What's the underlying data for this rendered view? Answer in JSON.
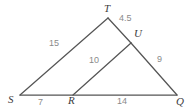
{
  "figure": {
    "kind": "geometry-diagram",
    "background_color": "#ffffff",
    "stroke_color": "#555555",
    "vertex_label_color": "#3d3d3d",
    "measure_label_color": "#8a8a8a",
    "vertices": [
      {
        "id": "T",
        "label": "T",
        "x": 108,
        "y": 18,
        "label_x": 104,
        "label_y": 3
      },
      {
        "id": "U",
        "label": "U",
        "x": 131,
        "y": 43,
        "label_x": 134,
        "label_y": 28
      },
      {
        "id": "S",
        "label": "S",
        "x": 20,
        "y": 95,
        "label_x": 8,
        "label_y": 94
      },
      {
        "id": "R",
        "label": "R",
        "x": 73,
        "y": 95,
        "label_x": 68,
        "label_y": 95
      },
      {
        "id": "Q",
        "label": "Q",
        "x": 177,
        "y": 95,
        "label_x": 176,
        "label_y": 96
      }
    ],
    "segments": [
      {
        "id": "ST",
        "from": "S",
        "to": "T"
      },
      {
        "id": "TU",
        "from": "T",
        "to": "U"
      },
      {
        "id": "UQ",
        "from": "U",
        "to": "Q"
      },
      {
        "id": "SQ",
        "from": "S",
        "to": "Q"
      },
      {
        "id": "RU",
        "from": "R",
        "to": "U"
      }
    ],
    "measures": [
      {
        "id": "ST",
        "segment": "ST",
        "value": "15",
        "x": 49,
        "y": 39
      },
      {
        "id": "TU",
        "segment": "TU",
        "value": "4.5",
        "x": 119,
        "y": 14
      },
      {
        "id": "UQ",
        "segment": "UQ",
        "value": "9",
        "x": 157,
        "y": 55
      },
      {
        "id": "RU",
        "segment": "RU",
        "value": "10",
        "x": 89,
        "y": 56
      },
      {
        "id": "SR",
        "segment": "SR",
        "value": "7",
        "x": 38,
        "y": 98
      },
      {
        "id": "RQ",
        "segment": "RQ",
        "value": "14",
        "x": 117,
        "y": 97
      }
    ]
  }
}
